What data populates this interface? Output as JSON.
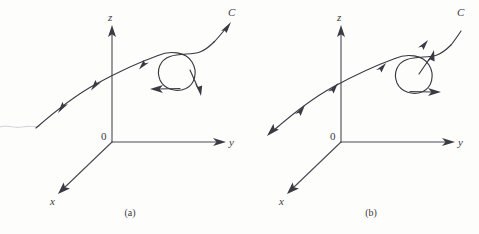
{
  "figure": {
    "background_color": "#fdfdfc",
    "stroke_color": "#3a3a42",
    "axis_color": "#4a4a52"
  },
  "panels": [
    {
      "id": "a",
      "caption": "(a)",
      "curve_label": "C",
      "orientation": "forward",
      "axes": {
        "z_label": "z",
        "y_label": "y",
        "x_label": "x",
        "origin_label": "0"
      },
      "loop": {
        "direction": "counterclockwise",
        "tangent_arrows": [
          "left",
          "down-right"
        ]
      },
      "curve_arrows": [
        "up-right",
        "up-right",
        "up-right",
        "up-right"
      ]
    },
    {
      "id": "b",
      "caption": "(b)",
      "curve_label": "C",
      "orientation": "reverse",
      "axes": {
        "z_label": "z",
        "y_label": "y",
        "x_label": "x",
        "origin_label": "0"
      },
      "loop": {
        "direction": "clockwise",
        "tangent_arrows": [
          "up",
          "right"
        ]
      },
      "curve_arrows": [
        "down-left",
        "down-left",
        "down-left",
        "down-left"
      ]
    }
  ]
}
